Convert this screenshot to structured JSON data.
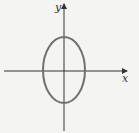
{
  "diagram": {
    "type": "ellipse-on-axes",
    "axes": {
      "x_label": "x",
      "y_label": "y"
    },
    "ellipse": {
      "center": [
        0,
        0
      ],
      "orientation": "vertical major axis",
      "stroke_color": "#707070"
    },
    "colors": {
      "background": "#f4f4f2",
      "axis": "#333333",
      "curve": "#707070"
    }
  }
}
